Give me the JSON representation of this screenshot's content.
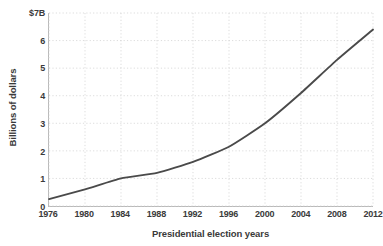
{
  "chart_data": {
    "type": "line",
    "title": "",
    "xlabel": "Presidential election years",
    "ylabel": "Billions of dollars",
    "x": [
      1976,
      1980,
      1984,
      1988,
      1992,
      1996,
      2000,
      2004,
      2008,
      2012
    ],
    "categories": [
      "1976",
      "1980",
      "1984",
      "1988",
      "1992",
      "1996",
      "2000",
      "2004",
      "2008",
      "2012"
    ],
    "values": [
      0.25,
      0.6,
      1.0,
      1.2,
      1.6,
      2.15,
      3.0,
      4.1,
      5.3,
      6.4
    ],
    "series": [
      {
        "name": "Campaign spending",
        "values": [
          0.25,
          0.6,
          1.0,
          1.2,
          1.6,
          2.15,
          3.0,
          4.1,
          5.3,
          6.4
        ]
      }
    ],
    "xlim": [
      1976,
      2012
    ],
    "ylim": [
      0,
      7
    ],
    "ytick_values": [
      0,
      1,
      2,
      3,
      4,
      5,
      6,
      7
    ],
    "ytick_labels": [
      "0",
      "1",
      "2",
      "3",
      "4",
      "5",
      "6",
      "$7B"
    ],
    "xtick_labels": [
      "1976",
      "1980",
      "1984",
      "1988",
      "1992",
      "1996",
      "2000",
      "2004",
      "2008",
      "2012"
    ],
    "grid": true,
    "grid_style": "dotted",
    "legend": false,
    "legend_position": "none",
    "line_color": "#4a4a4a",
    "grid_color": "#d3d3d3",
    "axis_color": "#b9b9b9",
    "background_color": "#ffffff",
    "text_color": "#3a3a3a"
  }
}
